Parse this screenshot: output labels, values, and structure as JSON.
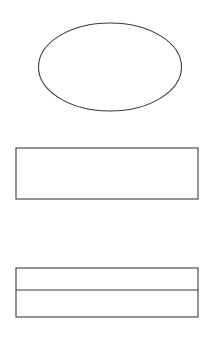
{
  "page": {
    "background_color": "#ffffff",
    "width": 213,
    "height": 341
  },
  "style": {
    "stroke_color": "#3c3c3c",
    "fill_color": "#ffffff",
    "stroke_width": 1.1
  },
  "shapes": [
    {
      "id": "ellipse",
      "name": "ellipse-shape",
      "kind": "ellipse",
      "label": "",
      "cx": 110,
      "cy": 67,
      "rx": 71.5,
      "ry": 44,
      "fill": "#ffffff",
      "stroke": "#3c3c3c"
    },
    {
      "id": "rectangle",
      "name": "rectangle-shape",
      "kind": "rectangle",
      "label": "",
      "x": 16,
      "y": 148,
      "width": 182,
      "height": 51,
      "fill": "#ffffff",
      "stroke": "#3c3c3c"
    },
    {
      "id": "divided-rectangle",
      "name": "divided-rectangle-shape",
      "kind": "rectangle-with-divider",
      "label": "",
      "x": 16,
      "y": 268,
      "width": 182,
      "height": 49,
      "divider_y": 290,
      "fill": "#ffffff",
      "stroke": "#3c3c3c"
    }
  ]
}
